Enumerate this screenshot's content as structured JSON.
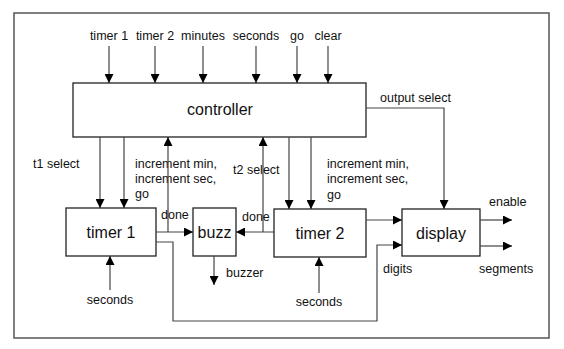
{
  "diagram": {
    "blocks": {
      "controller": {
        "label": "controller"
      },
      "timer1": {
        "label": "timer 1"
      },
      "buzz": {
        "label": "buzz"
      },
      "timer2": {
        "label": "timer 2"
      },
      "display": {
        "label": "display"
      }
    },
    "controller_inputs": [
      {
        "label": "timer 1"
      },
      {
        "label": "timer 2"
      },
      {
        "label": "minutes"
      },
      {
        "label": "seconds"
      },
      {
        "label": "go"
      },
      {
        "label": "clear"
      }
    ],
    "signals": {
      "output_select": "output select",
      "t1_select": "t1 select",
      "t2_select": "t2 select",
      "t1_increment": [
        "increment min,",
        "increment sec,",
        "go"
      ],
      "t2_increment": [
        "increment min,",
        "increment sec,",
        "go"
      ],
      "t1_done": "done",
      "t2_done": "done",
      "buzzer": "buzzer",
      "t1_seconds": "seconds",
      "t2_seconds": "seconds",
      "digits": "digits",
      "enable": "enable",
      "segments": "segments"
    }
  }
}
